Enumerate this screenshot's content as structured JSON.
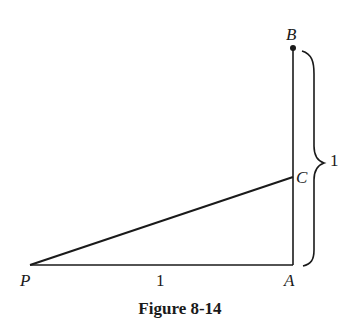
{
  "figure": {
    "caption": "Figure 8-14",
    "points": {
      "P": {
        "label": "P",
        "x": 30,
        "y": 265
      },
      "A": {
        "label": "A",
        "x": 293,
        "y": 265
      },
      "B": {
        "label": "B",
        "x": 293,
        "y": 48
      },
      "C": {
        "label": "C",
        "x": 293,
        "y": 177
      }
    },
    "segments": [
      {
        "from": "P",
        "to": "A",
        "length_label": "1"
      },
      {
        "from": "A",
        "to": "B"
      },
      {
        "from": "P",
        "to": "C"
      }
    ],
    "brace": {
      "spans": "A-B",
      "label": "1"
    },
    "labels": {
      "P": "P",
      "A": "A",
      "B": "B",
      "C": "C",
      "pa_length": "1",
      "ab_length": "1"
    },
    "colors": {
      "stroke": "#1a1a1a",
      "background": "#ffffff"
    }
  }
}
